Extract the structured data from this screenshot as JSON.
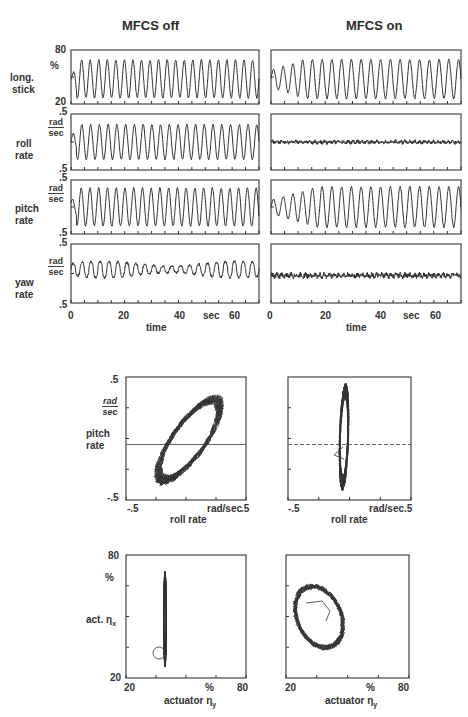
{
  "columns": {
    "off": {
      "title": "MFCS off"
    },
    "on": {
      "title": "MFCS on"
    }
  },
  "time_panels": [
    {
      "label_line1": "long.",
      "label_line2": "stick",
      "unit": "%",
      "y_top": "80",
      "y_bottom": "20"
    },
    {
      "label_line1": "roll",
      "label_line2": "rate",
      "unit_num": "rad",
      "unit_den": "sec",
      "y_top": ".5",
      "y_bottom": ".5"
    },
    {
      "label_line1": "pitch",
      "label_line2": "rate",
      "unit_num": "rad",
      "unit_den": "sec",
      "y_top": ".5",
      "y_bottom": ".5"
    },
    {
      "label_line1": "yaw",
      "label_line2": "rate",
      "unit_num": "rad",
      "unit_den": "sec",
      "y_top": ".5",
      "y_bottom": ".5"
    }
  ],
  "time_axis": {
    "ticks": [
      "0",
      "20",
      "40",
      "60"
    ],
    "unit": "sec",
    "label": "time"
  },
  "phase_rate": {
    "y_label_line1": "pitch",
    "y_label_line2": "rate",
    "y_unit_num": "rad",
    "y_unit_den": "sec",
    "y_top": ".5",
    "y_bottom": "-.5",
    "x_left": "-.5",
    "x_right_unit": "rad/sec",
    "x_right": ".5",
    "x_label": "roll rate"
  },
  "phase_act": {
    "y_label": "act. ηx",
    "y_label_base": "act. η",
    "y_label_sub": "x",
    "y_unit": "%",
    "y_top": "80",
    "y_bottom": "20",
    "x_left": "20",
    "x_unit": "%",
    "x_right": "80",
    "x_label_base": "actuator η",
    "x_label_sub": "y"
  },
  "chart_data": [
    {
      "type": "line",
      "title": "MFCS off — time histories",
      "xlabel": "time (sec)",
      "xlim": [
        0,
        70
      ],
      "x_ticks": [
        0,
        20,
        40,
        60
      ],
      "series": [
        {
          "name": "long. stick (%)",
          "ylim": [
            20,
            80
          ],
          "description": "sustained oscillation ~22 cycles, amplitude ~±20% about 50%"
        },
        {
          "name": "roll rate (rad/sec)",
          "ylim": [
            -0.5,
            0.5
          ],
          "description": "sustained oscillation, amplitude ~±0.3"
        },
        {
          "name": "pitch rate (rad/sec)",
          "ylim": [
            -0.5,
            0.5
          ],
          "description": "sustained oscillation, amplitude ~±0.35"
        },
        {
          "name": "yaw rate (rad/sec)",
          "ylim": [
            -0.5,
            0.5
          ],
          "description": "small irregular oscillation, amplitude ~±0.12"
        }
      ]
    },
    {
      "type": "line",
      "title": "MFCS on — time histories",
      "xlabel": "time (sec)",
      "xlim": [
        0,
        70
      ],
      "x_ticks": [
        0,
        20,
        40,
        60
      ],
      "series": [
        {
          "name": "long. stick (%)",
          "ylim": [
            20,
            80
          ],
          "description": "oscillation growing from ~±10% to ~±25%"
        },
        {
          "name": "roll rate (rad/sec)",
          "ylim": [
            -0.5,
            0.5
          ],
          "description": "near zero, noise ~±0.03"
        },
        {
          "name": "pitch rate (rad/sec)",
          "ylim": [
            -0.5,
            0.5
          ],
          "description": "oscillation growing to ~±0.35"
        },
        {
          "name": "yaw rate (rad/sec)",
          "ylim": [
            -0.5,
            0.5
          ],
          "description": "near zero, noise ~±0.05"
        }
      ]
    },
    {
      "type": "scatter",
      "title": "MFCS off — pitch rate vs roll rate",
      "xlabel": "roll rate (rad/sec)",
      "ylabel": "pitch rate (rad/sec)",
      "xlim": [
        -0.5,
        0.5
      ],
      "ylim": [
        -0.5,
        0.5
      ],
      "description": "tilted elliptical limit cycle from approx (-0.25,-0.35) to (0.35,0.3)"
    },
    {
      "type": "scatter",
      "title": "MFCS on — pitch rate vs roll rate",
      "xlabel": "roll rate (rad/sec)",
      "ylabel": "pitch rate (rad/sec)",
      "xlim": [
        -0.5,
        0.5
      ],
      "ylim": [
        -0.5,
        0.5
      ],
      "description": "narrow vertical band at roll rate ~-0.05, pitch rate -0.38 to 0.32"
    },
    {
      "type": "scatter",
      "title": "MFCS off — act. ηx vs actuator ηy",
      "xlabel": "actuator ηy (%)",
      "ylabel": "act. ηx (%)",
      "xlim": [
        20,
        80
      ],
      "ylim": [
        20,
        80
      ],
      "description": "vertical line at ηy ~40%, ηx 28 to 72%"
    },
    {
      "type": "scatter",
      "title": "MFCS on — act. ηx vs actuator ηy",
      "xlabel": "actuator ηy (%)",
      "ylabel": "act. ηx (%)",
      "xlim": [
        20,
        80
      ],
      "ylim": [
        20,
        80
      ],
      "description": "tilted ellipse centered ~(35%, 48%), ηy 26–53%, ηx 30–67%"
    }
  ]
}
